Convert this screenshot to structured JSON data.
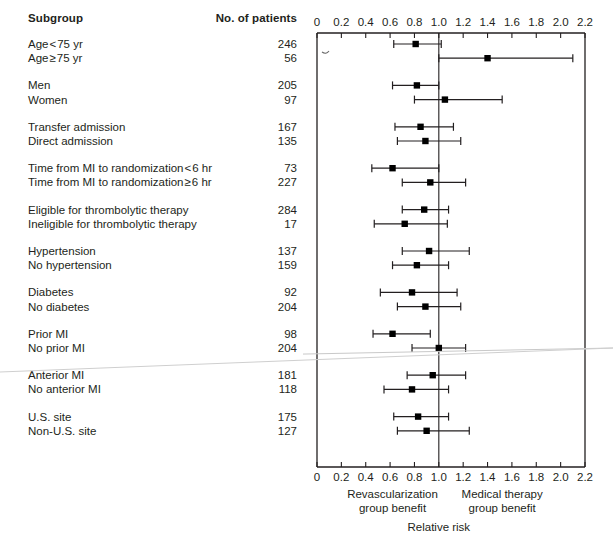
{
  "header": {
    "subgroup_label": "Subgroup",
    "npatients_label": "No. of patients"
  },
  "axis": {
    "tick_labels": [
      "0",
      "0.2",
      "0.4",
      "0.6",
      "0.8",
      "1.0",
      "1.2",
      "1.4",
      "1.6",
      "1.8",
      "2.0",
      "2.2"
    ],
    "left_caption_line1": "Revascularization",
    "left_caption_line2": "group benefit",
    "right_caption_line1": "Medical therapy",
    "right_caption_line2": "group benefit",
    "axis_title": "Relative risk"
  },
  "chart_data": {
    "type": "forest",
    "title": "",
    "xlabel": "Relative risk",
    "ylabel": "Subgroup",
    "xlim": [
      0,
      2.2
    ],
    "xticks": [
      0,
      0.2,
      0.4,
      0.6,
      0.8,
      1.0,
      1.2,
      1.4,
      1.6,
      1.8,
      2.0,
      2.2
    ],
    "grid": false,
    "null_value": 1.0,
    "left_benefit_label": "Revascularization group benefit",
    "right_benefit_label": "Medical therapy group benefit",
    "columns": [
      "Subgroup",
      "No. of patients",
      "Relative risk (95% CI)"
    ],
    "groups": [
      {
        "rows": [
          {
            "label": "Age < 75 yr",
            "label_pre": "Age",
            "rel": "<",
            "label_post": "75 yr",
            "n": "246",
            "estimate": 0.81,
            "ci_low": 0.63,
            "ci_high": 1.02
          },
          {
            "label": "Age ≥ 75 yr",
            "label_pre": "Age",
            "rel": "≥",
            "label_post": "75 yr",
            "n": "56",
            "estimate": 1.4,
            "ci_low": 1.0,
            "ci_high": 2.1
          }
        ]
      },
      {
        "rows": [
          {
            "label": "Men",
            "n": "205",
            "estimate": 0.82,
            "ci_low": 0.62,
            "ci_high": 1.0
          },
          {
            "label": "Women",
            "n": "97",
            "estimate": 1.05,
            "ci_low": 0.8,
            "ci_high": 1.52
          }
        ]
      },
      {
        "rows": [
          {
            "label": "Transfer admission",
            "n": "167",
            "estimate": 0.85,
            "ci_low": 0.64,
            "ci_high": 1.12
          },
          {
            "label": "Direct admission",
            "n": "135",
            "estimate": 0.89,
            "ci_low": 0.66,
            "ci_high": 1.18
          }
        ]
      },
      {
        "rows": [
          {
            "label": "Time from MI to randomization < 6 hr",
            "label_pre": "Time from MI to randomization",
            "rel": "<",
            "label_post": "6 hr",
            "n": "73",
            "estimate": 0.62,
            "ci_low": 0.45,
            "ci_high": 1.0
          },
          {
            "label": "Time from MI to randomization ≥ 6 hr",
            "label_pre": "Time from MI to randomization",
            "rel": "≥",
            "label_post": "6 hr",
            "n": "227",
            "estimate": 0.93,
            "ci_low": 0.7,
            "ci_high": 1.22
          }
        ]
      },
      {
        "rows": [
          {
            "label": "Eligible for thrombolytic therapy",
            "n": "284",
            "estimate": 0.88,
            "ci_low": 0.7,
            "ci_high": 1.08
          },
          {
            "label": "Ineligible for thrombolytic therapy",
            "n": "17",
            "estimate": 0.72,
            "ci_low": 0.47,
            "ci_high": 1.07
          }
        ]
      },
      {
        "rows": [
          {
            "label": "Hypertension",
            "n": "137",
            "estimate": 0.92,
            "ci_low": 0.7,
            "ci_high": 1.25
          },
          {
            "label": "No hypertension",
            "n": "159",
            "estimate": 0.82,
            "ci_low": 0.62,
            "ci_high": 1.08
          }
        ]
      },
      {
        "rows": [
          {
            "label": "Diabetes",
            "n": "92",
            "estimate": 0.78,
            "ci_low": 0.52,
            "ci_high": 1.15
          },
          {
            "label": "No diabetes",
            "n": "204",
            "estimate": 0.89,
            "ci_low": 0.66,
            "ci_high": 1.18
          }
        ]
      },
      {
        "rows": [
          {
            "label": "Prior MI",
            "n": "98",
            "estimate": 0.62,
            "ci_low": 0.46,
            "ci_high": 0.93
          },
          {
            "label": "No prior MI",
            "n": "204",
            "estimate": 1.0,
            "ci_low": 0.78,
            "ci_high": 1.22
          }
        ]
      },
      {
        "rows": [
          {
            "label": "Anterior MI",
            "n": "181",
            "estimate": 0.95,
            "ci_low": 0.74,
            "ci_high": 1.22
          },
          {
            "label": "No anterior MI",
            "n": "118",
            "estimate": 0.78,
            "ci_low": 0.55,
            "ci_high": 1.08
          }
        ]
      },
      {
        "rows": [
          {
            "label": "U.S. site",
            "n": "175",
            "estimate": 0.83,
            "ci_low": 0.63,
            "ci_high": 1.08
          },
          {
            "label": "Non-U.S. site",
            "n": "127",
            "estimate": 0.9,
            "ci_low": 0.66,
            "ci_high": 1.25
          }
        ]
      }
    ]
  }
}
